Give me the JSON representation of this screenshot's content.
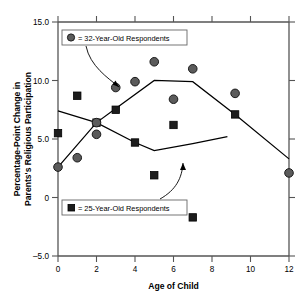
{
  "chart_data": {
    "type": "scatter",
    "title": "",
    "xlabel": "Age of Child",
    "ylabel": "Percentage-Point Change in Parents's Religious Participation",
    "ylabel_line1": "Percentage-Point Change in",
    "ylabel_line2": "Parents's Religious Participation",
    "xlim": [
      0,
      12
    ],
    "ylim": [
      -5.0,
      15.0
    ],
    "xticks": [
      0,
      2,
      4,
      6,
      8,
      10,
      12
    ],
    "xtick_labels": [
      "0",
      "2",
      "4",
      "6",
      "8",
      "10",
      "12"
    ],
    "yticks": [
      -5.0,
      0,
      5.0,
      10.0,
      15.0
    ],
    "ytick_labels": [
      "-5.0",
      "0",
      "5.0",
      "10.0",
      "15.0"
    ],
    "grid": false,
    "legend_position": "inside-upper-left-and-lower-left",
    "series": [
      {
        "name": "32-Year-Old Respondents",
        "marker": "circle",
        "color": "#5b5b5b",
        "points": [
          {
            "x": 0,
            "y": 2.6
          },
          {
            "x": 1,
            "y": 3.4
          },
          {
            "x": 2,
            "y": 5.4
          },
          {
            "x": 2,
            "y": 6.4
          },
          {
            "x": 3,
            "y": 9.4
          },
          {
            "x": 4,
            "y": 9.9
          },
          {
            "x": 5,
            "y": 11.6
          },
          {
            "x": 6,
            "y": 8.4
          },
          {
            "x": 7,
            "y": 11.0
          },
          {
            "x": 9.2,
            "y": 8.9
          },
          {
            "x": 12,
            "y": 2.1
          }
        ],
        "fit_line": [
          {
            "x": 0,
            "y": 2.6
          },
          {
            "x": 2,
            "y": 6.4
          },
          {
            "x": 3,
            "y": 7.6
          },
          {
            "x": 5,
            "y": 10.0
          },
          {
            "x": 7,
            "y": 9.9
          },
          {
            "x": 9.2,
            "y": 7.1
          },
          {
            "x": 12,
            "y": 3.3
          }
        ]
      },
      {
        "name": "25-Year-Old Respondents",
        "marker": "square",
        "color": "#1c1c1c",
        "points": [
          {
            "x": 0,
            "y": 5.5
          },
          {
            "x": 1,
            "y": 8.7
          },
          {
            "x": 2,
            "y": 6.4
          },
          {
            "x": 3,
            "y": 7.5
          },
          {
            "x": 4,
            "y": 4.7
          },
          {
            "x": 5,
            "y": 1.9
          },
          {
            "x": 6,
            "y": 6.2
          },
          {
            "x": 7,
            "y": -1.7
          },
          {
            "x": 9.2,
            "y": 7.1
          }
        ],
        "fit_line": [
          {
            "x": 0,
            "y": 7.4
          },
          {
            "x": 2,
            "y": 6.4
          },
          {
            "x": 4,
            "y": 4.7
          },
          {
            "x": 5,
            "y": 4.0
          },
          {
            "x": 7,
            "y": 4.6
          },
          {
            "x": 8.8,
            "y": 5.2
          }
        ]
      }
    ]
  },
  "legend": {
    "top": {
      "marker": "circle-marker",
      "separator": "=",
      "label": "= 32-Year-Old Respondents"
    },
    "bottom": {
      "marker": "square-marker",
      "separator": "=",
      "label": "= 25-Year-Old Respondents"
    }
  },
  "axes": {
    "x_title": "Age of Child",
    "y_title_line1": "Percentage-Point Change in",
    "y_title_line2": "Parents's Religious Participation",
    "x_tick_labels": [
      "0",
      "2",
      "4",
      "6",
      "8",
      "10",
      "12"
    ],
    "y_tick_labels": [
      "15.0",
      "10.0",
      "5.0",
      "0",
      "–5.0"
    ]
  }
}
